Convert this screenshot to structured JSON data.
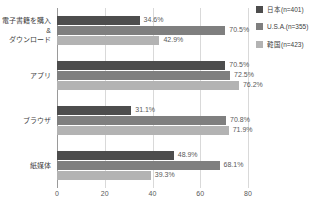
{
  "chart_data": {
    "type": "bar",
    "orientation": "horizontal",
    "title": "",
    "xlabel": "",
    "ylabel": "",
    "xlim": [
      0,
      80
    ],
    "xticks": [
      0,
      20,
      40,
      60,
      80
    ],
    "grid": true,
    "legend_position": "right",
    "categories": [
      "電子書籍を購入\n&\nダウンロード",
      "アプリ",
      "ブラウザ",
      "紙媒体"
    ],
    "series": [
      {
        "name": "日本(n=401)",
        "color": "#4d4d4d",
        "values": [
          34.6,
          70.5,
          31.1,
          48.9
        ],
        "labels": [
          "34.6%",
          "70.5%",
          "31.1%",
          "48.9%"
        ]
      },
      {
        "name": "U.S.A.(n=355)",
        "color": "#7f7f7f",
        "values": [
          70.5,
          72.5,
          70.8,
          68.1
        ],
        "labels": [
          "70.5%",
          "72.5%",
          "70.8%",
          "68.1%"
        ]
      },
      {
        "name": "韓国(n=423)",
        "color": "#b3b3b3",
        "values": [
          42.9,
          76.2,
          71.9,
          39.3
        ],
        "labels": [
          "42.9%",
          "76.2%",
          "71.9%",
          "39.3%"
        ]
      }
    ]
  },
  "legend": {
    "items": [
      {
        "label": "日本(n=401)",
        "color": "#4d4d4d"
      },
      {
        "label": "U.S.A.(n=355)",
        "color": "#7f7f7f"
      },
      {
        "label": "韓国(n=423)",
        "color": "#b3b3b3"
      }
    ]
  },
  "axis": {
    "x_tick_labels": [
      "0",
      "20",
      "40",
      "60",
      "80"
    ]
  },
  "y_categories": [
    {
      "lines": [
        "電子書籍を購入",
        "&",
        "ダウンロード"
      ]
    },
    {
      "lines": [
        "アプリ"
      ]
    },
    {
      "lines": [
        "ブラウザ"
      ]
    },
    {
      "lines": [
        "紙媒体"
      ]
    }
  ]
}
